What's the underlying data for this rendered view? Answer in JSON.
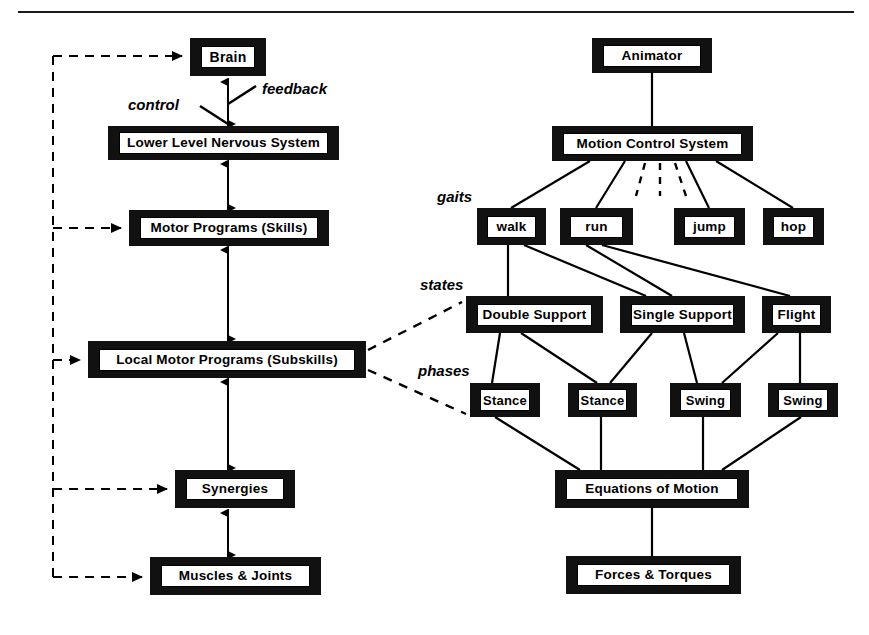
{
  "figure": {
    "has_top_rule": true
  },
  "annotations": [
    {
      "id": "control",
      "text": "control",
      "x": 128,
      "y": 96
    },
    {
      "id": "feedback",
      "text": "feedback",
      "x": 262,
      "y": 80
    },
    {
      "id": "gaits",
      "text": "gaits",
      "x": 437,
      "y": 188
    },
    {
      "id": "states",
      "text": "states",
      "x": 420,
      "y": 276
    },
    {
      "id": "phases",
      "text": "phases",
      "x": 418,
      "y": 362
    }
  ],
  "left_column": {
    "name": "biological motor control hierarchy",
    "nodes": [
      {
        "id": "brain",
        "label": "Brain",
        "x": 190,
        "y": 38,
        "w": 76,
        "h": 38,
        "font": "f15"
      },
      {
        "id": "lowerlevel",
        "label": "Lower Level Nervous System",
        "x": 108,
        "y": 126,
        "w": 231,
        "h": 34,
        "font": "f14"
      },
      {
        "id": "motorprog",
        "label": "Motor  Programs  (Skills)",
        "x": 129,
        "y": 210,
        "w": 200,
        "h": 36,
        "font": "f14"
      },
      {
        "id": "localmotor",
        "label": "Local  Motor  Programs  (Subskills)",
        "x": 88,
        "y": 341,
        "w": 278,
        "h": 37,
        "font": "f14"
      },
      {
        "id": "synergies",
        "label": "Synergies",
        "x": 175,
        "y": 470,
        "w": 120,
        "h": 38,
        "font": "f14"
      },
      {
        "id": "muscles",
        "label": "Muscles & Joints",
        "x": 150,
        "y": 557,
        "w": 171,
        "h": 38,
        "font": "f14"
      }
    ]
  },
  "right_column": {
    "name": "motion control system hierarchy",
    "root": {
      "id": "animator",
      "label": "Animator",
      "x": 592,
      "y": 38,
      "w": 120,
      "h": 35,
      "font": "f14"
    },
    "system": {
      "id": "mcs",
      "label": "Motion Control System",
      "x": 552,
      "y": 126,
      "w": 201,
      "h": 35,
      "font": "f14"
    },
    "gaits": [
      {
        "id": "walk",
        "label": "walk",
        "x": 477,
        "y": 208,
        "w": 69,
        "h": 37,
        "font": "f14"
      },
      {
        "id": "run",
        "label": "run",
        "x": 560,
        "y": 208,
        "w": 73,
        "h": 37,
        "font": "f14"
      },
      {
        "id": "jump",
        "label": "jump",
        "x": 674,
        "y": 208,
        "w": 71,
        "h": 37,
        "font": "f14"
      },
      {
        "id": "hop",
        "label": "hop",
        "x": 763,
        "y": 208,
        "w": 61,
        "h": 37,
        "font": "f14"
      }
    ],
    "gaits_more_indicator": "dashed-ellipsis-edges",
    "states": [
      {
        "id": "double",
        "label": "Double Support",
        "x": 466,
        "y": 296,
        "w": 137,
        "h": 37,
        "font": "f14"
      },
      {
        "id": "single",
        "label": "Single Support",
        "x": 620,
        "y": 296,
        "w": 125,
        "h": 37,
        "font": "f14"
      },
      {
        "id": "flight",
        "label": "Flight",
        "x": 762,
        "y": 296,
        "w": 69,
        "h": 37,
        "font": "f14"
      }
    ],
    "phases": [
      {
        "id": "stance1",
        "label": "Stance",
        "x": 470,
        "y": 383,
        "w": 70,
        "h": 34,
        "font": "f13"
      },
      {
        "id": "stance2",
        "label": "Stance",
        "x": 568,
        "y": 383,
        "w": 69,
        "h": 34,
        "font": "f13"
      },
      {
        "id": "swing1",
        "label": "Swing",
        "x": 670,
        "y": 383,
        "w": 71,
        "h": 34,
        "font": "f13"
      },
      {
        "id": "swing2",
        "label": "Swing",
        "x": 768,
        "y": 383,
        "w": 70,
        "h": 34,
        "font": "f13"
      }
    ],
    "dynamics": [
      {
        "id": "eom",
        "label": "Equations of Motion",
        "x": 555,
        "y": 470,
        "w": 194,
        "h": 38,
        "font": "f14"
      },
      {
        "id": "forces",
        "label": "Forces & Torques",
        "x": 566,
        "y": 556,
        "w": 175,
        "h": 38,
        "font": "f14"
      }
    ]
  },
  "colors": {
    "node_fill": "#111111",
    "plate_fill": "#ffffff",
    "text": "#000000",
    "edge": "#000000"
  }
}
